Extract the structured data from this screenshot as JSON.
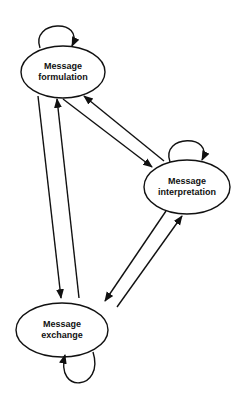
{
  "diagram": {
    "type": "state-transition",
    "nodes": [
      {
        "id": "formulation",
        "label_line1": "Message",
        "label_line2": "formulation",
        "cx": 63,
        "cy": 72,
        "rx": 42,
        "ry": 26
      },
      {
        "id": "interpretation",
        "label_line1": "Message",
        "label_line2": "interpretation",
        "cx": 187,
        "cy": 187,
        "rx": 43,
        "ry": 27
      },
      {
        "id": "exchange",
        "label_line1": "Message",
        "label_line2": "exchange",
        "cx": 62,
        "cy": 330,
        "rx": 46,
        "ry": 27
      }
    ],
    "edges": [
      {
        "from": "formulation",
        "to": "formulation",
        "kind": "self-loop"
      },
      {
        "from": "interpretation",
        "to": "interpretation",
        "kind": "self-loop"
      },
      {
        "from": "exchange",
        "to": "exchange",
        "kind": "self-loop"
      },
      {
        "from": "formulation",
        "to": "exchange"
      },
      {
        "from": "exchange",
        "to": "formulation"
      },
      {
        "from": "formulation",
        "to": "interpretation"
      },
      {
        "from": "interpretation",
        "to": "formulation"
      },
      {
        "from": "interpretation",
        "to": "exchange"
      },
      {
        "from": "exchange",
        "to": "interpretation"
      }
    ],
    "colors": {
      "stroke": "#111111",
      "background": "#ffffff"
    }
  }
}
